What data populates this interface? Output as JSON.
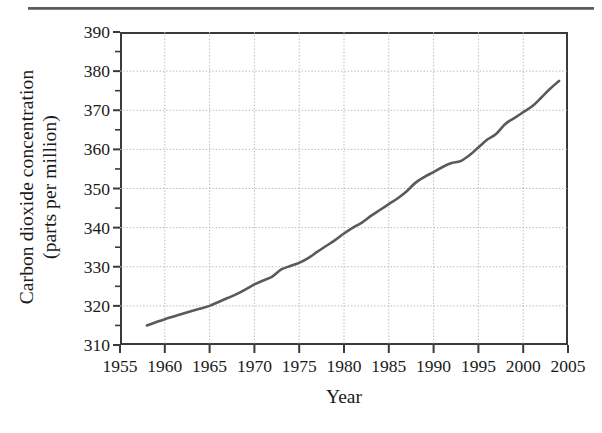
{
  "figure": {
    "has_top_rule": true,
    "line_color": "#5a5a5a",
    "axis_color": "#3a3a3a",
    "grid_color": "#b9b9b9",
    "background": "#ffffff"
  },
  "chart_data": {
    "type": "line",
    "title": "",
    "xlabel": "Year",
    "ylabel_line1": "Carbon dioxide concentration",
    "ylabel_line2": "(parts per million)",
    "ylabel": "Carbon dioxide concentration (parts per million)",
    "xlim": [
      1955,
      2005
    ],
    "ylim": [
      310,
      390
    ],
    "xticks": [
      1955,
      1960,
      1965,
      1970,
      1975,
      1980,
      1985,
      1990,
      1995,
      2000,
      2005
    ],
    "yticks": [
      310,
      320,
      330,
      340,
      350,
      360,
      370,
      380,
      390
    ],
    "xtick_labels": [
      "1955",
      "1960",
      "1965",
      "1970",
      "1975",
      "1980",
      "1985",
      "1990",
      "1995",
      "2000",
      "2005"
    ],
    "ytick_labels": [
      "310",
      "320",
      "330",
      "340",
      "350",
      "360",
      "370",
      "380",
      "390"
    ],
    "grid": true,
    "grid_style": "dotted",
    "legend": null,
    "series": [
      {
        "name": "Atmospheric CO2 concentration",
        "x": [
          1958,
          1959,
          1960,
          1961,
          1962,
          1963,
          1964,
          1965,
          1966,
          1967,
          1968,
          1969,
          1970,
          1971,
          1972,
          1973,
          1974,
          1975,
          1976,
          1977,
          1978,
          1979,
          1980,
          1981,
          1982,
          1983,
          1984,
          1985,
          1986,
          1987,
          1988,
          1989,
          1990,
          1991,
          1992,
          1993,
          1994,
          1995,
          1996,
          1997,
          1998,
          1999,
          2000,
          2001,
          2002,
          2003,
          2004
        ],
        "values": [
          315.0,
          315.8,
          316.6,
          317.3,
          318.0,
          318.7,
          319.3,
          320.0,
          321.0,
          322.0,
          323.0,
          324.2,
          325.5,
          326.5,
          327.5,
          329.3,
          330.2,
          331.0,
          332.2,
          333.8,
          335.3,
          336.8,
          338.5,
          340.0,
          341.3,
          343.0,
          344.5,
          346.0,
          347.5,
          349.3,
          351.5,
          353.0,
          354.2,
          355.5,
          356.5,
          357.0,
          358.5,
          360.5,
          362.5,
          364.0,
          366.5,
          368.0,
          369.5,
          371.0,
          373.2,
          375.5,
          377.5
        ]
      }
    ],
    "notes": [
      "Rising monotonic trend; visible slope flattening near 1973-1975, 1991-1993 and 1997-1998"
    ]
  }
}
